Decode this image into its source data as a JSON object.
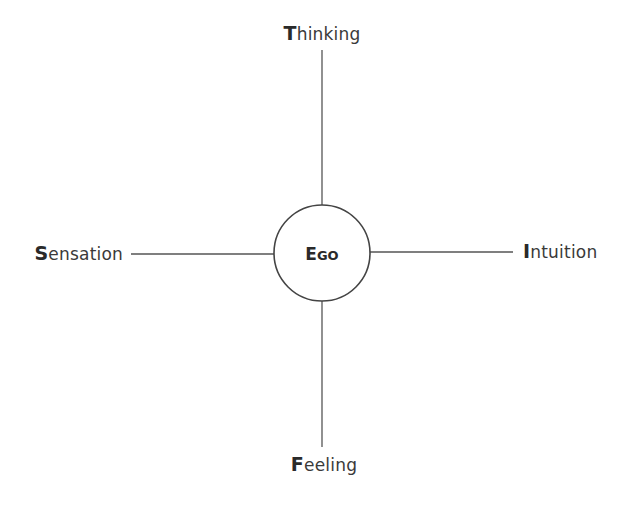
{
  "diagram": {
    "type": "jungian-functions-cross",
    "center": {
      "label_initial": "E",
      "label_rest": "GO"
    },
    "functions": {
      "top": {
        "initial": "T",
        "rest": "hinking"
      },
      "left": {
        "initial": "S",
        "rest": "ensation"
      },
      "right": {
        "initial": "I",
        "rest": "ntuition"
      },
      "bottom": {
        "initial": "F",
        "rest": "eeling"
      }
    },
    "colors": {
      "text": "#3a3a3a",
      "line": "#555555",
      "circle_stroke": "#444444",
      "background": "#ffffff"
    }
  }
}
